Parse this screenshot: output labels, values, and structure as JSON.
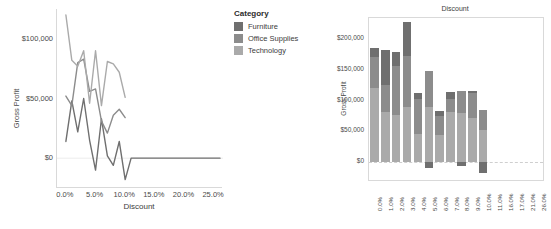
{
  "colors": {
    "furniture": "#6f6f6f",
    "office_supplies": "#8c8c8c",
    "technology": "#aaaaaa",
    "axis": "#d9d9d9",
    "text": "#4a4a4a"
  },
  "legend": {
    "title": "Category",
    "items": [
      {
        "label": "Furniture",
        "color": "#6f6f6f"
      },
      {
        "label": "Office Supplies",
        "color": "#8c8c8c"
      },
      {
        "label": "Technology",
        "color": "#aaaaaa"
      }
    ]
  },
  "chart_data": [
    {
      "id": "line-chart",
      "type": "line",
      "title": "",
      "xlabel": "Discount",
      "ylabel": "Gross Profit",
      "xlim": [
        -1.5,
        26.5
      ],
      "ylim": [
        -25000,
        125000
      ],
      "xticks": [
        "0.0%",
        "5.0%",
        "10.0%",
        "15.0%",
        "20.0%",
        "25.0%"
      ],
      "xtick_values": [
        0,
        5,
        10,
        15,
        20,
        25
      ],
      "yticks": [
        "$0",
        "$50,000",
        "$100,000"
      ],
      "ytick_values": [
        0,
        50000,
        100000
      ],
      "grid": false,
      "legend_position": "right",
      "x": [
        0,
        1,
        2,
        3,
        4,
        5,
        6,
        7,
        8,
        9,
        10,
        11,
        16,
        17,
        21,
        26
      ],
      "series": [
        {
          "name": "Furniture",
          "color": "#6f6f6f",
          "values": [
            14000,
            48000,
            22000,
            50000,
            15000,
            -10000,
            33000,
            2000,
            -6000,
            14000,
            -18000,
            0,
            0,
            0,
            0,
            0
          ]
        },
        {
          "name": "Office Supplies",
          "color": "#8c8c8c",
          "values": [
            52000,
            44000,
            80000,
            83000,
            56000,
            58000,
            31000,
            21000,
            36000,
            41000,
            34000,
            null,
            null,
            null,
            null,
            null
          ]
        },
        {
          "name": "Technology",
          "color": "#aaaaaa",
          "values": [
            120000,
            82000,
            77000,
            90000,
            46000,
            90000,
            44000,
            81000,
            79000,
            72000,
            51000,
            null,
            null,
            null,
            null,
            null
          ]
        }
      ]
    },
    {
      "id": "bar-chart",
      "type": "bar",
      "title": "Discount",
      "xlabel": "",
      "ylabel": "Gross Profit",
      "stacked": true,
      "ylim": [
        -30000,
        235000
      ],
      "yticks": [
        "$0",
        "$50,000",
        "$100,000",
        "$150,000",
        "$200,000"
      ],
      "ytick_values": [
        0,
        50000,
        100000,
        150000,
        200000
      ],
      "grid": false,
      "categories": [
        "0.0%",
        "1.0%",
        "2.0%",
        "3.0%",
        "4.0%",
        "5.0%",
        "6.0%",
        "7.0%",
        "8.0%",
        "9.0%",
        "10.0%",
        "11.0%",
        "16.0%",
        "17.0%",
        "21.0%",
        "26.0%"
      ],
      "series": [
        {
          "name": "Technology",
          "color": "#aaaaaa",
          "values": [
            120000,
            82000,
            77000,
            90000,
            46000,
            90000,
            44000,
            81000,
            79000,
            72000,
            51000,
            0,
            0,
            0,
            0,
            0
          ]
        },
        {
          "name": "Office Supplies",
          "color": "#8c8c8c",
          "values": [
            52000,
            44000,
            80000,
            83000,
            56000,
            58000,
            31000,
            21000,
            36000,
            41000,
            34000,
            0,
            0,
            0,
            0,
            0
          ]
        },
        {
          "name": "Furniture",
          "color": "#6f6f6f",
          "values": [
            14000,
            56000,
            22000,
            55000,
            11000,
            -10000,
            8000,
            12000,
            -7000,
            2000,
            -18000,
            0,
            0,
            0,
            0,
            0
          ]
        }
      ]
    }
  ]
}
